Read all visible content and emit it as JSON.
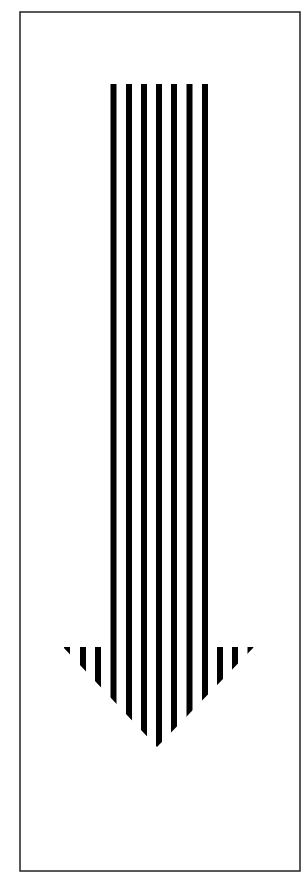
{
  "figure": {
    "icon": "arrow-down-striped-icon",
    "colors": {
      "background": "#ffffff",
      "stripe": "#000000",
      "frame": "#222222"
    },
    "frame": {
      "x": 20,
      "y": 12,
      "width": 280,
      "height": 859,
      "stroke_width": 1.5
    },
    "shaft": {
      "top": 84,
      "bottom": 746
    },
    "arrowhead": {
      "top_y": 647,
      "left_x": 63,
      "right_x": 254,
      "apex_x": 157,
      "apex_y": 747
    },
    "stripes": {
      "count_shaft": 7,
      "count_total": 13,
      "width": 6,
      "pitch": 15.25,
      "x_positions": [
        64,
        80,
        95,
        110.5,
        126,
        141,
        156,
        171,
        186.5,
        202,
        217,
        232,
        247.5
      ]
    }
  }
}
